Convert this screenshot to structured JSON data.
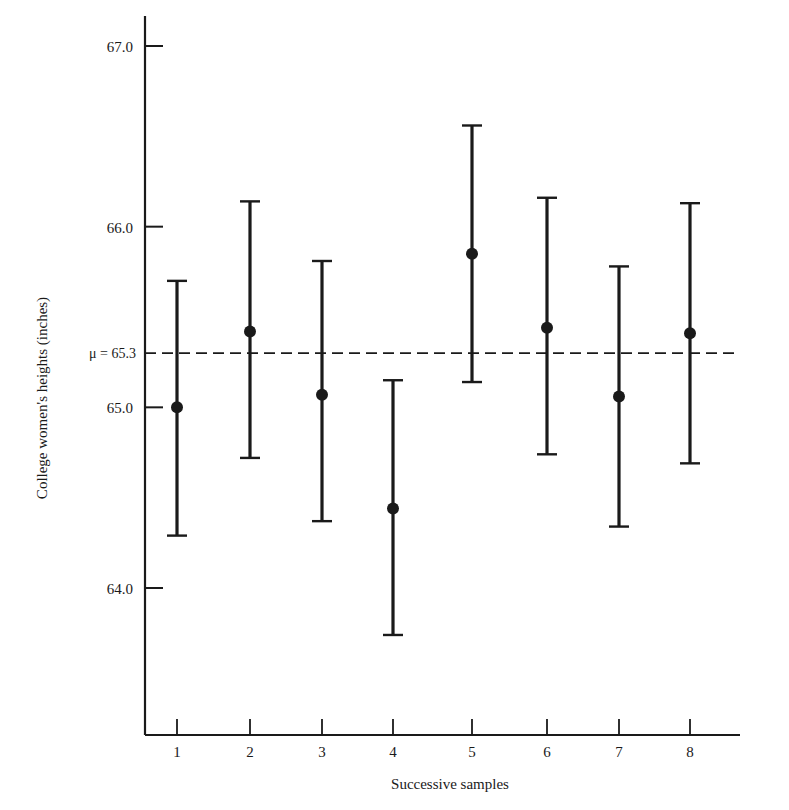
{
  "chart_data": {
    "type": "errorbar",
    "title": "",
    "xlabel": "Successive samples",
    "ylabel": "College women's heights (inches)",
    "ylim": [
      63.3,
      67.2
    ],
    "yticks": [
      67.0,
      66.0,
      65.0,
      64.0
    ],
    "ytick_labels": [
      "67.0",
      "66.0",
      "65.0",
      "64.0"
    ],
    "categories": [
      "1",
      "2",
      "3",
      "4",
      "5",
      "6",
      "7",
      "8"
    ],
    "reference_line": {
      "label": "μ = 65.3",
      "value": 65.3,
      "style": "dashed"
    },
    "series": [
      {
        "name": "Sample mean with confidence interval",
        "means": [
          65.0,
          65.42,
          65.07,
          64.44,
          65.85,
          65.44,
          65.06,
          65.41
        ],
        "lower": [
          64.29,
          64.72,
          64.37,
          63.74,
          65.14,
          64.74,
          64.34,
          64.69
        ],
        "upper": [
          65.7,
          66.14,
          65.81,
          65.15,
          66.56,
          66.16,
          65.78,
          66.13
        ]
      }
    ],
    "grid": false,
    "legend": null
  },
  "labels": {
    "xlabel": "Successive samples",
    "ylabel": "College women's heights (inches)",
    "mu_label": "μ = 65.3"
  }
}
